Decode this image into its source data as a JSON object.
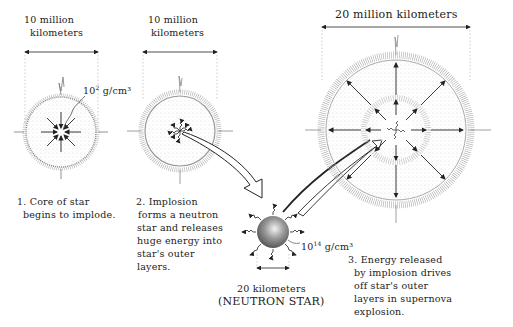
{
  "stages": [
    {
      "id": 1,
      "scale_label_line1": "10 million",
      "scale_label_line2": "kilometers",
      "density_base": "10",
      "density_exp": "2",
      "density_unit": "g/cm³",
      "caption_lines": [
        "1. Core of star",
        "begins to implode."
      ]
    },
    {
      "id": 2,
      "scale_label_line1": "10 million",
      "scale_label_line2": "kilometers",
      "caption_lines": [
        "2. Implosion",
        "forms a neutron",
        "star and releases",
        "huge energy into",
        "star's outer",
        "layers."
      ]
    },
    {
      "id": 3,
      "scale_label": "20 million kilometers",
      "caption_lines": [
        "3. Energy released",
        "by implosion drives",
        "off star's outer",
        "layers in supernova",
        "explosion."
      ]
    }
  ],
  "neutron_star": {
    "scale_label": "20 kilometers",
    "name_label": "(NEUTRON STAR)",
    "density_base": "10",
    "density_exp": "14",
    "density_unit": "g/cm³"
  },
  "colors": {
    "ink": "#222222",
    "background": "#ffffff",
    "dots": "#9a9a9a"
  }
}
